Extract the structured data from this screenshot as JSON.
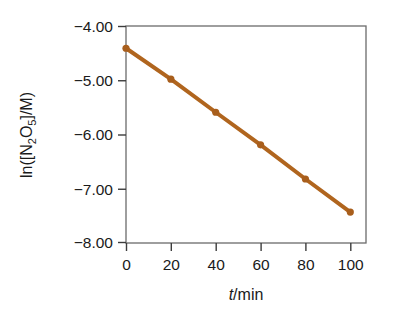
{
  "chart_data": {
    "type": "line",
    "title": "",
    "subtitle": "",
    "xlabel": "t/min",
    "ylabel": "ln([N2O5]/M)",
    "ylabel_parts": {
      "prefix": "ln([N",
      "sub1": "2",
      "mid": "O",
      "sub2": "5",
      "suffix": "]/M)"
    },
    "xlabel_parts": {
      "italic": "t",
      "rest": "/min"
    },
    "x": [
      0,
      20,
      40,
      60,
      80,
      100
    ],
    "values": [
      -4.41,
      -4.98,
      -5.59,
      -6.19,
      -6.82,
      -7.43
    ],
    "series": [
      {
        "name": "ln([N2O5]/M) vs t",
        "values": [
          -4.41,
          -4.98,
          -5.59,
          -6.19,
          -6.82,
          -7.43
        ]
      }
    ],
    "xlim": [
      0,
      107
    ],
    "ylim": [
      -8.0,
      -4.0
    ],
    "xticks": [
      0,
      20,
      40,
      60,
      80,
      100
    ],
    "xtick_labels": [
      "0",
      "20",
      "40",
      "60",
      "80",
      "100"
    ],
    "yticks": [
      -4.0,
      -5.0,
      -6.0,
      -7.0,
      -8.0
    ],
    "ytick_labels": [
      "−4.00",
      "−5.00",
      "−6.00",
      "−7.00",
      "−8.00"
    ],
    "grid": false,
    "legend": null,
    "line_color": "#b0651e",
    "marker_color": "#a85e1c",
    "frame_color": "#6b6b6b",
    "background": "#ffffff",
    "marker": "circle",
    "line_width": 4
  }
}
